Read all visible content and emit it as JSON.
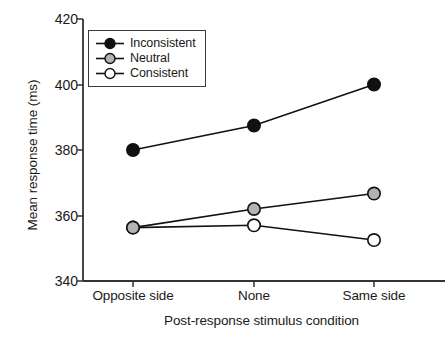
{
  "chart_data": {
    "type": "line",
    "title": "",
    "subtitle": "",
    "xlabel": "Post-response stimulus condition",
    "ylabel": "Mean response time (ms)",
    "categories": [
      "Opposite side",
      "None",
      "Same side"
    ],
    "ylim": [
      340,
      420
    ],
    "yticks": [
      340,
      360,
      380,
      400,
      420
    ],
    "ytick_labels": [
      "340",
      "360",
      "380",
      "400",
      "420"
    ],
    "grid": false,
    "legend_position": "upper left (inside axes)",
    "series": [
      {
        "name": "Inconsistent",
        "values": [
          380.0,
          387.5,
          400.0
        ],
        "marker": "filled-circle",
        "marker_fill": "#111111",
        "line_color": "#111111"
      },
      {
        "name": "Neutral",
        "values": [
          356.3,
          362.0,
          366.7
        ],
        "marker": "gray-circle",
        "marker_fill": "#b3b3b3",
        "line_color": "#111111"
      },
      {
        "name": "Consistent",
        "values": [
          356.3,
          357.0,
          352.5
        ],
        "marker": "open-circle",
        "marker_fill": "#ffffff",
        "line_color": "#111111"
      }
    ]
  },
  "axes": {
    "spine_color": "#333333",
    "background": "#ffffff"
  }
}
